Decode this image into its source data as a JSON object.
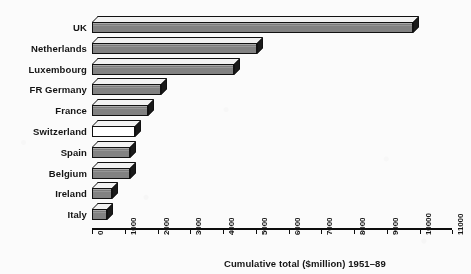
{
  "chart_data": {
    "type": "bar",
    "orientation": "horizontal",
    "title": "",
    "xlabel": "Cumulative total ($million) 1951–89",
    "ylabel": "",
    "xlim": [
      0,
      11000
    ],
    "xticks": [
      0,
      1000,
      2000,
      3000,
      4000,
      5000,
      6000,
      7000,
      8000,
      9000,
      10000,
      11000
    ],
    "xtick_labels": [
      "0",
      "1000",
      "2000",
      "3000",
      "4000",
      "5000",
      "6000",
      "7000",
      "8000",
      "9000",
      "10000",
      "11000"
    ],
    "grid": false,
    "legend": null,
    "style": "3d-shaded-bars",
    "categories": [
      "UK",
      "Netherlands",
      "Luxembourg",
      "FR Germany",
      "France",
      "Switzerland",
      "Spain",
      "Belgium",
      "Ireland",
      "Italy"
    ],
    "values": [
      9800,
      5050,
      4350,
      2100,
      1700,
      1300,
      1150,
      1150,
      600,
      450
    ],
    "bar_fills": [
      "gray",
      "gray",
      "gray",
      "gray",
      "gray",
      "white",
      "gray",
      "gray",
      "gray",
      "gray"
    ]
  },
  "colors": {
    "background": "#fbfbfb",
    "bar_gray": "#8a8a8a",
    "bar_white": "#ffffff",
    "bar_top": "#f2f2f2",
    "bar_side": "#1a1a1a",
    "outline": "#111111",
    "axis": "#0d0d0d",
    "text": "#141414"
  },
  "axis": {
    "title": "Cumulative total ($million) 1951–89"
  }
}
